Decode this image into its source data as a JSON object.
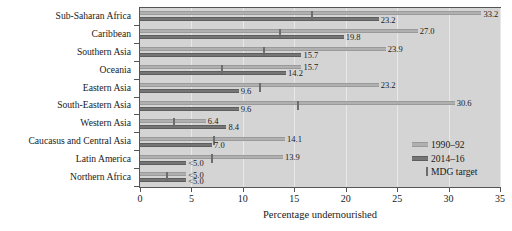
{
  "chart_data": {
    "type": "bar",
    "orientation": "horizontal",
    "title": "",
    "xlabel": "Percentage undernourished",
    "ylabel": "",
    "xlim": [
      0,
      35
    ],
    "xticks": [
      0,
      5,
      10,
      15,
      20,
      25,
      30,
      35
    ],
    "grid": true,
    "legend_position": "inside-right",
    "categories": [
      "Sub-Saharan Africa",
      "Caribbean",
      "Southern Asia",
      "Oceania",
      "Eastern Asia",
      "South-Eastern Asia",
      "Western Asia",
      "Caucasus and Central Asia",
      "Latin America",
      "Northern Africa"
    ],
    "series": [
      {
        "name": "1990–92",
        "color": "#b0b0b0",
        "values": [
          33.2,
          27.0,
          23.9,
          15.7,
          23.2,
          30.6,
          6.4,
          14.1,
          13.9,
          4.5
        ],
        "labels": [
          "33.2",
          "27.0",
          "23.9",
          "15.7",
          "23.2",
          "30.6",
          "6.4",
          "14.1",
          "13.9",
          "<5.0"
        ]
      },
      {
        "name": "2014–16",
        "color": "#757575",
        "values": [
          23.2,
          19.8,
          15.7,
          14.2,
          9.6,
          9.6,
          8.4,
          7.0,
          4.5,
          4.5
        ],
        "labels": [
          "23.2",
          "19.8",
          "15.7",
          "14.2",
          "9.6",
          "9.6",
          "8.4",
          "7.0",
          "<5.0",
          "<5.0"
        ]
      }
    ],
    "marker_series": {
      "name": "MDG target",
      "color": "#8c8c8c",
      "values": [
        16.6,
        13.5,
        11.95,
        7.85,
        11.6,
        15.3,
        3.2,
        7.05,
        6.95,
        2.5
      ]
    }
  },
  "legend": {
    "items": [
      {
        "label": "1990–92",
        "swatch": "old"
      },
      {
        "label": "2014–16",
        "swatch": "new"
      },
      {
        "label": "MDG target",
        "swatch": "mdg"
      }
    ]
  }
}
